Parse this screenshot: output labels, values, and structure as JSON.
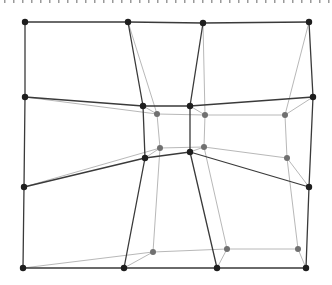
{
  "diagram": {
    "colors": {
      "dark_line": "#3a3a3a",
      "dark_node": "#1e1e1e",
      "light_line": "#b8b8b8",
      "light_node": "#707070",
      "background": "#ffffff"
    },
    "dark_nodes": [
      {
        "id": "d00",
        "x": 25,
        "y": 22
      },
      {
        "id": "d01",
        "x": 128,
        "y": 22
      },
      {
        "id": "d02",
        "x": 203,
        "y": 23
      },
      {
        "id": "d03",
        "x": 309,
        "y": 22
      },
      {
        "id": "d10",
        "x": 25,
        "y": 97
      },
      {
        "id": "d11",
        "x": 143,
        "y": 106
      },
      {
        "id": "d12",
        "x": 190,
        "y": 106
      },
      {
        "id": "d13",
        "x": 313,
        "y": 97
      },
      {
        "id": "d20",
        "x": 24,
        "y": 187
      },
      {
        "id": "d21",
        "x": 145,
        "y": 158
      },
      {
        "id": "d22",
        "x": 190,
        "y": 152
      },
      {
        "id": "d23",
        "x": 309,
        "y": 187
      },
      {
        "id": "d30",
        "x": 23,
        "y": 268
      },
      {
        "id": "d31",
        "x": 124,
        "y": 268
      },
      {
        "id": "d32",
        "x": 217,
        "y": 268
      },
      {
        "id": "d33",
        "x": 306,
        "y": 268
      }
    ],
    "light_nodes": [
      {
        "id": "l11",
        "x": 157,
        "y": 114
      },
      {
        "id": "l12",
        "x": 205,
        "y": 115
      },
      {
        "id": "l13",
        "x": 285,
        "y": 115
      },
      {
        "id": "l21",
        "x": 160,
        "y": 148
      },
      {
        "id": "l22",
        "x": 204,
        "y": 147
      },
      {
        "id": "l23",
        "x": 287,
        "y": 158
      },
      {
        "id": "l31",
        "x": 153,
        "y": 252
      },
      {
        "id": "l32",
        "x": 227,
        "y": 249
      },
      {
        "id": "l33",
        "x": 298,
        "y": 249
      }
    ],
    "dark_edges": [
      [
        "d00",
        "d01"
      ],
      [
        "d01",
        "d02"
      ],
      [
        "d02",
        "d03"
      ],
      [
        "d10",
        "d11"
      ],
      [
        "d11",
        "d12"
      ],
      [
        "d12",
        "d13"
      ],
      [
        "d20",
        "d21"
      ],
      [
        "d21",
        "d22"
      ],
      [
        "d22",
        "d23"
      ],
      [
        "d30",
        "d31"
      ],
      [
        "d31",
        "d32"
      ],
      [
        "d32",
        "d33"
      ],
      [
        "d00",
        "d10"
      ],
      [
        "d10",
        "d20"
      ],
      [
        "d20",
        "d30"
      ],
      [
        "d01",
        "d11"
      ],
      [
        "d11",
        "d21"
      ],
      [
        "d21",
        "d31"
      ],
      [
        "d02",
        "d12"
      ],
      [
        "d12",
        "d22"
      ],
      [
        "d22",
        "d32"
      ],
      [
        "d03",
        "d13"
      ],
      [
        "d13",
        "d23"
      ],
      [
        "d23",
        "d33"
      ]
    ],
    "light_edges": [
      [
        "d10",
        "l11"
      ],
      [
        "l11",
        "l12"
      ],
      [
        "l12",
        "l13"
      ],
      [
        "d20",
        "l21"
      ],
      [
        "l21",
        "l22"
      ],
      [
        "l22",
        "l23"
      ],
      [
        "d30",
        "l31"
      ],
      [
        "l31",
        "l32"
      ],
      [
        "l32",
        "l33"
      ],
      [
        "d01",
        "l11"
      ],
      [
        "l11",
        "l21"
      ],
      [
        "l21",
        "l31"
      ],
      [
        "d02",
        "l12"
      ],
      [
        "l12",
        "l22"
      ],
      [
        "l22",
        "l32"
      ],
      [
        "d03",
        "l13"
      ],
      [
        "l13",
        "l23"
      ],
      [
        "l23",
        "l33"
      ],
      [
        "d11",
        "l11"
      ],
      [
        "d12",
        "l12"
      ],
      [
        "d13",
        "l13"
      ],
      [
        "d21",
        "l21"
      ],
      [
        "d22",
        "l22"
      ],
      [
        "d23",
        "l23"
      ],
      [
        "d31",
        "l31"
      ],
      [
        "d32",
        "l32"
      ],
      [
        "d33",
        "l33"
      ]
    ]
  }
}
